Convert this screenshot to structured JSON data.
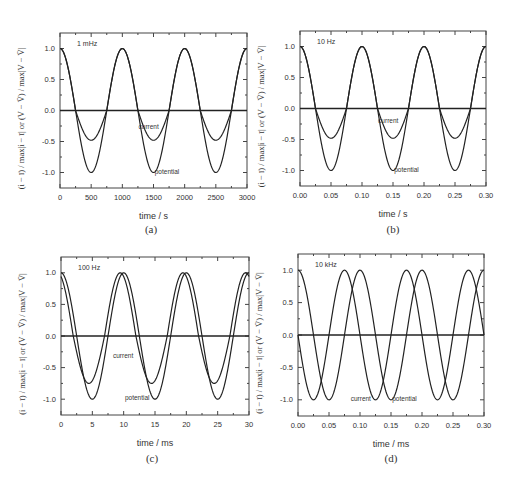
{
  "chart_data": [
    {
      "id": "a",
      "type": "line",
      "caption": "(a)",
      "annotation": "1 mHz",
      "xlabel": "time / s",
      "ylabel": "(i − ī) / max|i − ī|  or  (V − V̄) / max|V − V̄|",
      "xlim": [
        0,
        3000
      ],
      "ylim": [
        -1.25,
        1.25
      ],
      "xticks": [
        0,
        500,
        1000,
        1500,
        2000,
        2500,
        3000
      ],
      "xtick_labels": [
        "0",
        "500",
        "1000",
        "1500",
        "2000",
        "2500",
        "3000"
      ],
      "yticks": [
        -1.0,
        -0.5,
        0.0,
        0.5,
        1.0
      ],
      "ytick_labels": [
        "-1.0",
        "-0.5",
        "0.0",
        "0.5",
        "1.0"
      ],
      "period": 1000,
      "series": [
        {
          "name": "potential",
          "amplitude": 1.0,
          "phase_shift": 0,
          "label_pos": [
            1520,
            -0.98
          ]
        },
        {
          "name": "current",
          "amplitude_pos": 1.0,
          "amplitude_neg": 0.48,
          "phase_shift": 0,
          "label_pos": [
            1260,
            -0.25
          ]
        }
      ],
      "zero_line": true,
      "frame": {
        "left": 60,
        "top": 33,
        "right": 247,
        "bottom": 188
      }
    },
    {
      "id": "b",
      "type": "line",
      "caption": "(b)",
      "annotation": "10 Hz",
      "xlabel": "time / s",
      "ylabel": "(i − ī) / max|i − ī|  or  (V − V̄) / max|V − V̄|",
      "xlim": [
        0,
        0.3
      ],
      "ylim": [
        -1.25,
        1.25
      ],
      "xticks": [
        0,
        0.05,
        0.1,
        0.15,
        0.2,
        0.25,
        0.3
      ],
      "xtick_labels": [
        "0.00",
        "0.05",
        "0.10",
        "0.15",
        "0.20",
        "0.25",
        "0.30"
      ],
      "yticks": [
        -1.0,
        -0.5,
        0.0,
        0.5,
        1.0
      ],
      "ytick_labels": [
        "-1.0",
        "-0.5",
        "0.0",
        "0.5",
        "1.0"
      ],
      "period": 0.1,
      "series": [
        {
          "name": "potential",
          "amplitude": 1.0,
          "phase_shift": 0,
          "label_pos": [
            0.152,
            -0.98
          ]
        },
        {
          "name": "current",
          "amplitude_pos": 1.0,
          "amplitude_neg": 0.48,
          "phase_shift": 0,
          "label_pos": [
            0.126,
            -0.19
          ]
        }
      ],
      "zero_line": true,
      "frame": {
        "left": 300,
        "top": 31,
        "right": 486,
        "bottom": 186
      }
    },
    {
      "id": "c",
      "type": "line",
      "caption": "(c)",
      "annotation": "100 Hz",
      "xlabel": "time / ms",
      "ylabel": "(i − ī) / max|i − ī|  or  (V − V̄) / max|V − V̄|",
      "xlim": [
        0,
        30
      ],
      "ylim": [
        -1.25,
        1.25
      ],
      "xticks": [
        0,
        5,
        10,
        15,
        20,
        25,
        30
      ],
      "xtick_labels": [
        "0",
        "5",
        "10",
        "15",
        "20",
        "25",
        "30"
      ],
      "yticks": [
        -1.0,
        -0.5,
        0.0,
        0.5,
        1.0
      ],
      "ytick_labels": [
        "-1.0",
        "-0.5",
        "0.0",
        "0.5",
        "1.0"
      ],
      "period": 10,
      "series": [
        {
          "name": "potential",
          "amplitude": 1.0,
          "phase_shift": 0,
          "label_pos": [
            10.2,
            -0.98
          ]
        },
        {
          "name": "current",
          "amplitude_pos": 1.0,
          "amplitude_neg": 0.75,
          "phase_shift": -0.55,
          "label_pos": [
            8.3,
            -0.31
          ]
        }
      ],
      "zero_line": true,
      "frame": {
        "left": 61,
        "top": 257,
        "right": 249,
        "bottom": 415
      }
    },
    {
      "id": "d",
      "type": "line",
      "caption": "(d)",
      "annotation": "10 kHz",
      "xlabel": "time / ms",
      "ylabel": "(i − ī) / max|i − ī|  or  (V − V̄) / max|V − V̄|",
      "xlim": [
        0,
        0.3
      ],
      "ylim": [
        -1.25,
        1.25
      ],
      "xticks": [
        0,
        0.05,
        0.1,
        0.15,
        0.2,
        0.25,
        0.3
      ],
      "xtick_labels": [
        "0.00",
        "0.05",
        "0.10",
        "0.15",
        "0.20",
        "0.25",
        "0.30"
      ],
      "yticks": [
        -1.0,
        -0.5,
        0.0,
        0.5,
        1.0
      ],
      "ytick_labels": [
        "-1.0",
        "-0.5",
        "0.0",
        "0.5",
        "1.0"
      ],
      "period": 0.1,
      "series": [
        {
          "name": "potential",
          "amplitude": 1.0,
          "phase_shift": 0,
          "label_pos": [
            0.152,
            -0.98
          ]
        },
        {
          "name": "current",
          "amplitude_pos": 1.0,
          "amplitude_neg": 1.0,
          "phase_shift": -0.025,
          "label_pos": [
            0.085,
            -0.98
          ]
        }
      ],
      "zero_line": true,
      "frame": {
        "left": 298,
        "top": 254,
        "right": 484,
        "bottom": 416
      }
    }
  ],
  "captions": {
    "a": "(a)",
    "b": "(b)",
    "c": "(c)",
    "d": "(d)"
  },
  "ylabel_text": "(i − ī) / max|i − ī|  or  (V − V̄) / max|V − V̄|"
}
